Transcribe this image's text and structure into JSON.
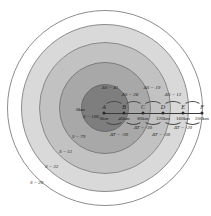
{
  "figure": {
    "center_origin_label": "0km",
    "center_value_label": "S = 100"
  },
  "chart_data": {
    "type": "contour-diagram",
    "title": "",
    "xlabel": "",
    "ylabel": "",
    "points": [
      {
        "id": "A",
        "label": "A",
        "distance": "0km",
        "x_px": 104
      },
      {
        "id": "B",
        "label": "B",
        "distance": "40km",
        "x_px": 124
      },
      {
        "id": "C",
        "label": "C",
        "distance": "80km",
        "x_px": 143
      },
      {
        "id": "D",
        "label": "D",
        "distance": "120km",
        "x_px": 163
      },
      {
        "id": "E",
        "label": "E",
        "distance": "160km",
        "x_px": 183
      },
      {
        "id": "F",
        "label": "F",
        "distance": "200km",
        "x_px": 202
      }
    ],
    "delta_s_upper": [
      {
        "label": "ΔS = 41",
        "x_px": 110,
        "y_px": 85
      },
      {
        "label": "ΔS = 19",
        "x_px": 152,
        "y_px": 85
      }
    ],
    "delta_s_lower": [
      {
        "label": "ΔS = 28",
        "x_px": 130,
        "y_px": 92
      },
      {
        "label": "ΔS = 12",
        "x_px": 173,
        "y_px": 92
      }
    ],
    "delta_t_upper": [
      {
        "label": "ΔT = -30",
        "x_px": 143,
        "y_px": 125
      },
      {
        "label": "ΔT = -20",
        "x_px": 183,
        "y_px": 125
      }
    ],
    "delta_t_lower": [
      {
        "label": "ΔT = -30",
        "x_px": 119,
        "y_px": 132
      },
      {
        "label": "ΔT = -30",
        "x_px": 161,
        "y_px": 132
      }
    ],
    "contour_labels": [
      {
        "label": "S = 100",
        "x_px": 83,
        "y_px": 114
      },
      {
        "label": "S = 79",
        "x_px": 72,
        "y_px": 134
      },
      {
        "label": "S = 51",
        "x_px": 59,
        "y_px": 149
      },
      {
        "label": "S = 32",
        "x_px": 45,
        "y_px": 164
      },
      {
        "label": "S = 20",
        "x_px": 30,
        "y_px": 180
      }
    ],
    "contour_values": [
      100,
      79,
      51,
      32,
      20
    ],
    "colors": {
      "ring_1": "#7e7e7e",
      "ring_2": "#a8a8a8",
      "ring_3": "#c2c2c2",
      "ring_4": "#d9d9d9",
      "ring_5": "#ffffff",
      "axis": "#3a3a3a",
      "background": "#ffffff"
    }
  }
}
